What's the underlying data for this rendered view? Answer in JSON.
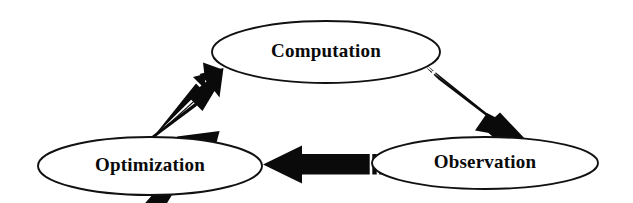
{
  "diagram": {
    "background_color": "#ffffff",
    "line_color": "#111111",
    "arrow_color": "#0a0a0a",
    "nodes": [
      {
        "id": "computation",
        "label": "Computation",
        "cx": 326,
        "cy": 52,
        "rx": 114,
        "ry": 31
      },
      {
        "id": "optimization",
        "label": "Optimization",
        "cx": 150,
        "cy": 166,
        "rx": 112,
        "ry": 29
      },
      {
        "id": "observation",
        "label": "Observation",
        "cx": 485,
        "cy": 163,
        "rx": 113,
        "ry": 26
      }
    ],
    "arrows": [
      {
        "id": "optimization-to-computation",
        "from": "optimization",
        "to": "computation",
        "direction": "up-right",
        "notches": 2
      },
      {
        "id": "computation-to-observation",
        "from": "computation",
        "to": "observation",
        "direction": "down-right",
        "notches": 2
      },
      {
        "id": "observation-to-optimization",
        "from": "observation",
        "to": "optimization",
        "direction": "left",
        "notches": 2
      }
    ]
  }
}
